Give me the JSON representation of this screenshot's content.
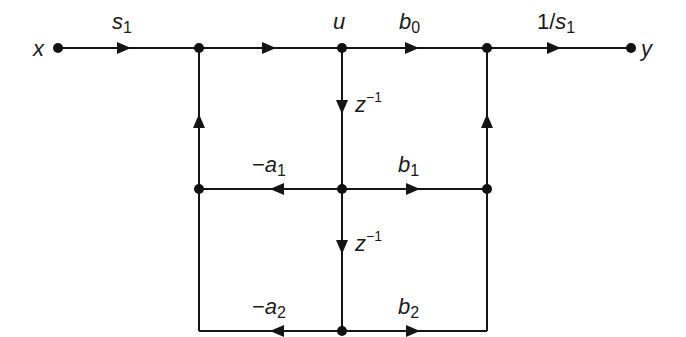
{
  "diagram": {
    "type": "signal-flow-graph",
    "nodes": [
      {
        "id": "x",
        "label": "x",
        "pos": [
          58,
          48
        ]
      },
      {
        "id": "n1",
        "label": "",
        "pos": [
          199,
          48
        ]
      },
      {
        "id": "u",
        "label": "u",
        "pos": [
          342,
          48
        ]
      },
      {
        "id": "n3",
        "label": "",
        "pos": [
          487,
          48
        ]
      },
      {
        "id": "y",
        "label": "y",
        "pos": [
          631,
          48
        ]
      },
      {
        "id": "n4",
        "label": "",
        "pos": [
          199,
          189
        ]
      },
      {
        "id": "n5",
        "label": "",
        "pos": [
          342,
          189
        ]
      },
      {
        "id": "n6",
        "label": "",
        "pos": [
          487,
          189
        ]
      },
      {
        "id": "n8",
        "label": "",
        "pos": [
          342,
          331
        ]
      }
    ],
    "edges": [
      {
        "from": "x",
        "to": "n1",
        "gain": "s1"
      },
      {
        "from": "n1",
        "to": "u",
        "gain": ""
      },
      {
        "from": "u",
        "to": "n3",
        "gain": "b0"
      },
      {
        "from": "n3",
        "to": "y",
        "gain": "1/s1"
      },
      {
        "from": "u",
        "to": "n5",
        "gain": "z^-1"
      },
      {
        "from": "n5",
        "to": "n4",
        "gain": "-a1"
      },
      {
        "from": "n5",
        "to": "n6",
        "gain": "b1"
      },
      {
        "from": "n4",
        "to": "n1",
        "gain": ""
      },
      {
        "from": "n6",
        "to": "n3",
        "gain": ""
      },
      {
        "from": "n5",
        "to": "n8",
        "gain": "z^-1"
      },
      {
        "from": "n8",
        "to": "n4",
        "gain": "-a2"
      },
      {
        "from": "n8",
        "to": "n6",
        "gain": "b2"
      }
    ],
    "labels": {
      "x": "x",
      "y": "y",
      "u": "u",
      "s1_base": "s",
      "s1_sub": "1",
      "b0_base": "b",
      "b0_sub": "0",
      "inv_s1_prefix": "1/",
      "inv_s1_base": "s",
      "inv_s1_sub": "1",
      "z_base": "z",
      "z_sup": "−1",
      "a1_sign": "−",
      "a1_base": "a",
      "a1_sub": "1",
      "b1_base": "b",
      "b1_sub": "1",
      "a2_sign": "−",
      "a2_base": "a",
      "a2_sub": "2",
      "b2_base": "b",
      "b2_sub": "2"
    },
    "colors": {
      "ink": "#141414",
      "background": "#ffffff"
    }
  }
}
